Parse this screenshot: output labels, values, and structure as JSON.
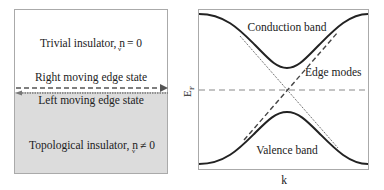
{
  "left_panel": {
    "trivial_label": "Trivial insulator, n",
    "trivial_sub": "ν",
    "trivial_rel": "= 0",
    "right_edge_label": "Right moving edge state",
    "left_edge_label": "Left moving edge state",
    "topological_label": "Topological insulator, n",
    "topological_sub": "ν",
    "topological_rel": "≠ 0",
    "colors": {
      "trivial_bg": "#ffffff",
      "topological_bg": "#dcdcdc",
      "border": "#aaaaaa"
    }
  },
  "right_panel": {
    "conduction_label": "Conduction band",
    "valence_label": "Valence band",
    "edge_modes_label": "Edge modes",
    "y_axis_label": "E",
    "y_axis_sub": "F",
    "x_axis_label": "k"
  }
}
